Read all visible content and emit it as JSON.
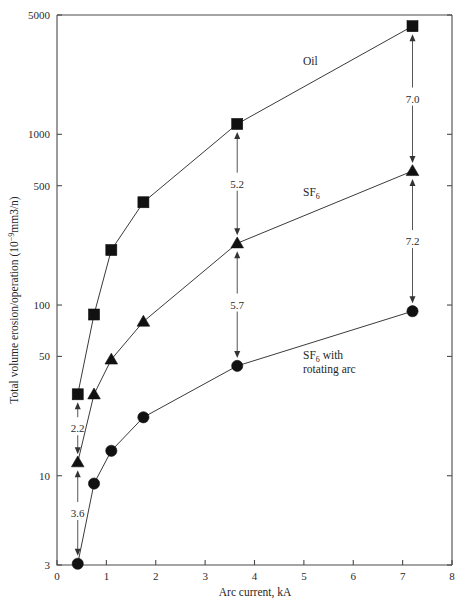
{
  "chart_data": {
    "type": "line",
    "title": "",
    "xlabel": "Arc current, kA",
    "ylabel": "Total volume erosion/operation (10−9mm3/n)",
    "ylabel_main": "Total volume erosion/operation (10",
    "ylabel_exp": "−9",
    "ylabel_tail": "mm3/n)",
    "xlim": [
      0,
      8
    ],
    "ylim": [
      3,
      5000
    ],
    "yscale": "log",
    "xscale": "linear",
    "grid": false,
    "legend_position": "inline-annotations",
    "xticks": [
      "0",
      "1",
      "2",
      "3",
      "4",
      "5",
      "6",
      "7",
      "8"
    ],
    "xtick_values": [
      0,
      1,
      2,
      3,
      4,
      5,
      6,
      7,
      8
    ],
    "yticks": [
      "3",
      "10",
      "50",
      "100",
      "500",
      "1000",
      "5000"
    ],
    "ytick_values": [
      3,
      10,
      50,
      100,
      500,
      1000,
      5000
    ],
    "series": [
      {
        "name": "Oil",
        "marker": "square",
        "label": "Oil",
        "x": [
          0.42,
          0.75,
          1.1,
          1.75,
          3.65,
          7.2
        ],
        "y": [
          30,
          88,
          210,
          400,
          1150,
          4300
        ]
      },
      {
        "name": "SF6",
        "marker": "triangle",
        "label": "SF6",
        "label_main": "SF",
        "label_sub": "6",
        "x": [
          0.42,
          0.75,
          1.1,
          1.75,
          3.65,
          7.2
        ],
        "y": [
          12,
          30,
          48,
          80,
          230,
          610
        ]
      },
      {
        "name": "SF6 with rotating arc",
        "marker": "circle",
        "label": "SF6 with rotating arc",
        "label_main": "SF",
        "label_sub": "6",
        "label_tail": " with",
        "label_line2": "rotating arc",
        "x": [
          0.42,
          0.75,
          1.1,
          1.75,
          3.65,
          7.2
        ],
        "y": [
          3.05,
          9,
          14,
          22,
          44,
          92
        ]
      }
    ],
    "annotations": [
      {
        "id": "ann-2-2",
        "text": "2.2",
        "x": 0.42,
        "y_top": 30,
        "y_bottom": 12,
        "desc": "ratio Oil to SF6 at 0.42 kA"
      },
      {
        "id": "ann-3-6",
        "text": "3.6",
        "x": 0.42,
        "y_top": 12,
        "y_bottom": 3.05,
        "desc": "ratio SF6 to SF6-rotating at 0.42 kA"
      },
      {
        "id": "ann-5-2",
        "text": "5.2",
        "x": 3.65,
        "y_top": 1150,
        "y_bottom": 230,
        "desc": "ratio Oil to SF6 at 3.65 kA"
      },
      {
        "id": "ann-5-7",
        "text": "5.7",
        "x": 3.65,
        "y_top": 230,
        "y_bottom": 44,
        "desc": "ratio SF6 to SF6-rotating at 3.65 kA"
      },
      {
        "id": "ann-7-0",
        "text": "7.0",
        "x": 7.2,
        "y_top": 4300,
        "y_bottom": 610,
        "desc": "ratio Oil to SF6 at 7.2 kA"
      },
      {
        "id": "ann-7-2",
        "text": "7.2",
        "x": 7.2,
        "y_top": 610,
        "y_bottom": 92,
        "desc": "ratio SF6 to SF6-rotating at 7.2 kA"
      }
    ],
    "colors": {
      "marker": "#111111",
      "curve": "#3a3a3a",
      "axis": "#4a4a4a",
      "text": "#1f1f1f",
      "background": "#ffffff"
    }
  }
}
